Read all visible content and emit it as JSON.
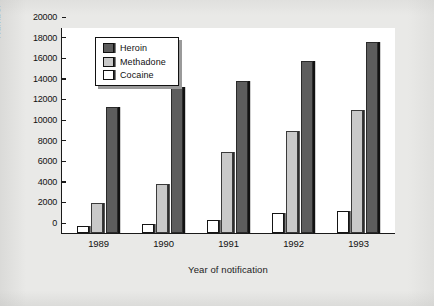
{
  "chart_data": {
    "type": "bar",
    "title": "",
    "subtitle": "",
    "xlabel": "Year of notification",
    "ylabel": "Number of notifications",
    "categories": [
      "1989",
      "1990",
      "1991",
      "1992",
      "1993"
    ],
    "series": [
      {
        "name": "Heroin",
        "color": "#5d5d5d",
        "values": [
          12200,
          14200,
          14800,
          16700,
          18500
        ]
      },
      {
        "name": "Methadone",
        "color": "#c9c9c9",
        "values": [
          2900,
          4800,
          7900,
          9900,
          11900
        ]
      },
      {
        "name": "Cocaine",
        "color": "#ffffff",
        "values": [
          700,
          900,
          1300,
          1900,
          2150
        ]
      }
    ],
    "ylim": [
      0,
      20000
    ],
    "ytick_labels": [
      "0",
      "2000",
      "4000",
      "6000",
      "8000",
      "10000",
      "12000",
      "14000",
      "16000",
      "18000",
      "20000"
    ],
    "ytick_values": [
      0,
      2000,
      4000,
      6000,
      8000,
      10000,
      12000,
      14000,
      16000,
      18000,
      20000
    ],
    "grid": false,
    "legend_position": "top-left-inside",
    "bar_group_order": [
      "Cocaine",
      "Methadone",
      "Heroin"
    ]
  },
  "legend": {
    "items": [
      {
        "label": "Heroin"
      },
      {
        "label": "Methadone"
      },
      {
        "label": "Cocaine"
      }
    ]
  },
  "colors": {
    "background": "#e9e9e7",
    "plot_background": "#ffffff",
    "axis": "#1a1a1a",
    "heroin": "#5d5d5d",
    "methadone": "#c9c9c9",
    "cocaine": "#ffffff"
  }
}
